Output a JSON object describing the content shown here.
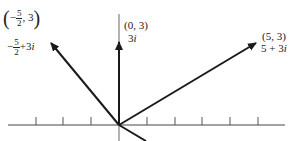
{
  "diagram": {
    "type": "complex plane vector diagram",
    "origin_px": [
      119,
      125
    ],
    "unit_px": 27.7,
    "axis": {
      "x_start": 8,
      "x_end": 285,
      "y": 125,
      "tick_x": [
        36,
        63,
        91,
        147,
        175,
        202,
        230,
        258
      ],
      "tick_height": 8
    },
    "stroke_color": "#1a1a1a",
    "vectors": [
      {
        "name": "left",
        "point": [
          -2.5,
          3
        ],
        "coord_label": {
          "open": "(",
          "sign": "−",
          "num": "5",
          "den": "2",
          "rest": ", 3",
          "close": ")"
        },
        "complex_label": {
          "sign": "−",
          "num": "5",
          "den": "2",
          "rest": "+3",
          "imag": "i"
        }
      },
      {
        "name": "up",
        "point": [
          0,
          3
        ],
        "coord_label": "(0, 3)",
        "complex_label": {
          "real": "3",
          "imag": "i"
        }
      },
      {
        "name": "right",
        "point": [
          5,
          3
        ],
        "coord_label": "(5, 3)",
        "complex_label": {
          "real": "5 + 3",
          "imag": "i"
        }
      }
    ]
  }
}
